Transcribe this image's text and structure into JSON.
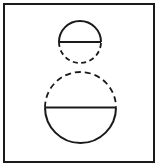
{
  "diagram": {
    "type": "geometric-figure",
    "colors": {
      "background": "#ffffff",
      "stroke": "#1a1a1a"
    },
    "frame": {
      "x": 4,
      "y": 4,
      "width": 150,
      "height": 158
    },
    "small_circle": {
      "cx": 80,
      "cy": 42,
      "r": 21,
      "solid_half": "top",
      "dashed_half": "bottom"
    },
    "large_circle": {
      "cx": 80.5,
      "cy": 107.5,
      "r": 35.5,
      "solid_half": "bottom",
      "dashed_half": "top"
    }
  }
}
